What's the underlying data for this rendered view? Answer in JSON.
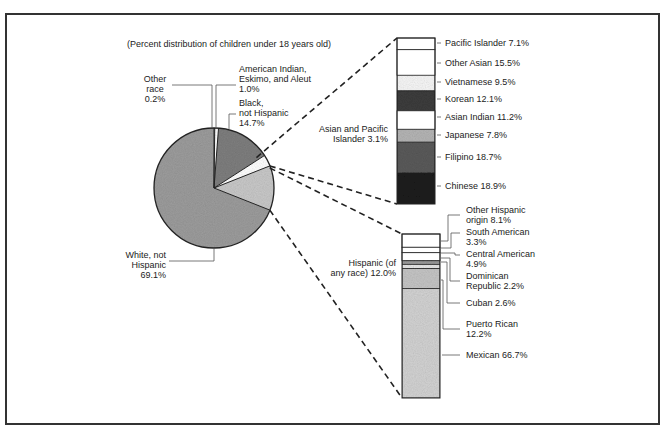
{
  "subtitle": "(Percent distribution of children under 18 years old)",
  "chart_data": [
    {
      "type": "pie",
      "title": "(Percent distribution of children under 18 years old)",
      "categories": [
        "White, not Hispanic",
        "Other race",
        "American Indian, Eskimo, and Aleut",
        "Black, not Hispanic",
        "Asian and Pacific Islander",
        "Hispanic (of any race)"
      ],
      "values": [
        69.1,
        0.2,
        1.0,
        14.7,
        3.1,
        12.0
      ],
      "unit": "%"
    },
    {
      "type": "bar",
      "stacked": true,
      "title": "Asian and Pacific Islander 3.1%",
      "categories": [
        "Pacific Islander",
        "Other Asian",
        "Vietnamese",
        "Korean",
        "Asian Indian",
        "Japanese",
        "Filipino",
        "Chinese"
      ],
      "values": [
        7.1,
        15.5,
        9.5,
        12.1,
        11.2,
        7.8,
        18.7,
        18.9
      ],
      "unit": "%"
    },
    {
      "type": "bar",
      "stacked": true,
      "title": "Hispanic (of any race) 12.0%",
      "categories": [
        "Other Hispanic origin",
        "South American",
        "Central American",
        "Dominican Republic",
        "Cuban",
        "Puerto Rican",
        "Mexican"
      ],
      "values": [
        8.1,
        3.3,
        4.9,
        2.2,
        2.6,
        12.2,
        66.7
      ],
      "unit": "%"
    }
  ],
  "pie_labels": {
    "other_race": [
      "Other",
      "race",
      "0.2%"
    ],
    "american_indian": [
      "American Indian,",
      "Eskimo, and Aleut",
      "1.0%"
    ],
    "black": [
      "Black,",
      "not Hispanic",
      "14.7%"
    ],
    "white": [
      "White, not",
      "Hispanic",
      "69.1%"
    ]
  },
  "asian_bar": {
    "title": [
      "Asian and Pacific",
      "Islander 3.1%"
    ],
    "labels": [
      "Pacific Islander 7.1%",
      "Other Asian 15.5%",
      "Vietnamese 9.5%",
      "Korean 12.1%",
      "Asian Indian 11.2%",
      "Japanese 7.8%",
      "Filipino 18.7%",
      "Chinese 18.9%"
    ]
  },
  "hispanic_bar": {
    "title": [
      "Hispanic (of",
      "any race) 12.0%"
    ],
    "labels": [
      [
        "Other Hispanic",
        "origin 8.1%"
      ],
      [
        "South American",
        "3.3%"
      ],
      [
        "Central American",
        "4.9%"
      ],
      [
        "Dominican",
        "Republic 2.2%"
      ],
      [
        "Cuban 2.6%"
      ],
      [
        "Puerto Rican",
        "12.2%"
      ],
      [
        "Mexican 66.7%"
      ]
    ]
  }
}
